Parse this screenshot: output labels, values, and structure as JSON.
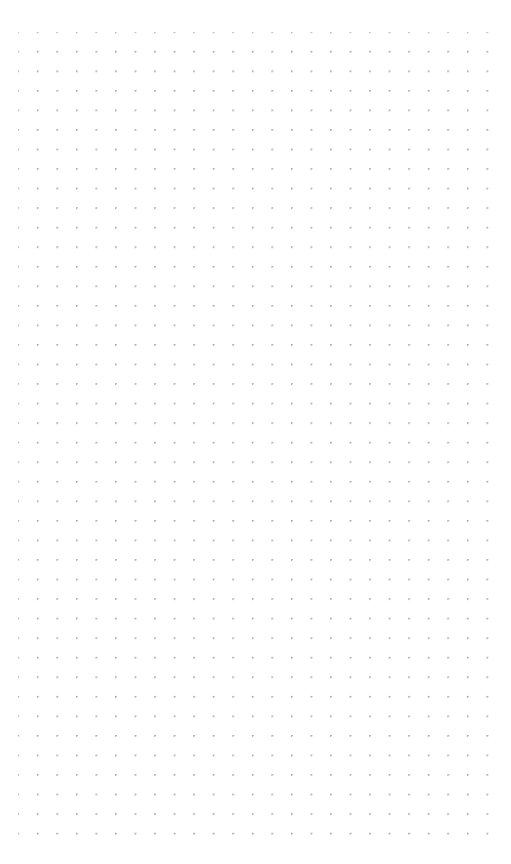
{
  "document": {
    "title": "Dot Grid Page",
    "kind": "blank-dot-grid-paper",
    "page_label": "",
    "content_text": ""
  },
  "canvas": {
    "width_px": 511,
    "height_px": 864,
    "background_color": "#ffffff"
  },
  "grid": {
    "pattern": "dot-grid",
    "dot_color": "#a7a7ad",
    "dot_diameter_px": 1.4,
    "spacing_x_px": 19.55,
    "spacing_y_px": 19.55,
    "origin_x_px": 18,
    "origin_y_px": 32,
    "columns": 24,
    "rows": 42,
    "margin_left_px": 18,
    "margin_top_px": 32,
    "margin_right_px": 33,
    "margin_bottom_px": 32,
    "extent_x_px": 478,
    "extent_y_px": 832
  }
}
